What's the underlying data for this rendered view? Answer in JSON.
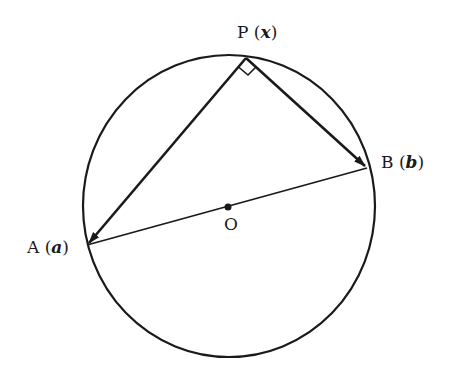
{
  "diagram": {
    "type": "geometry",
    "colors": {
      "stroke": "#1a1a1a",
      "background": "#ffffff"
    },
    "points": {
      "P": {
        "name": "P",
        "vector": "x",
        "x": 246,
        "y": 58
      },
      "A": {
        "name": "A",
        "vector": "a",
        "x": 87,
        "y": 245
      },
      "B": {
        "name": "B",
        "vector": "b",
        "x": 367,
        "y": 168
      },
      "O": {
        "name": "O",
        "x": 228,
        "y": 207
      }
    },
    "labels": {
      "P": {
        "letter": "P",
        "open": "(",
        "vec": "x",
        "close": ")"
      },
      "A": {
        "letter": "A",
        "open": "(",
        "vec": "a",
        "close": ")"
      },
      "B": {
        "letter": "B",
        "open": "(",
        "vec": "b",
        "close": ")"
      },
      "O": {
        "letter": "O"
      }
    },
    "edges": [
      {
        "from": "P",
        "to": "A",
        "arrow": true
      },
      {
        "from": "P",
        "to": "B",
        "arrow": true
      },
      {
        "from": "A",
        "to": "B",
        "arrow": false
      }
    ],
    "right_angle_marker": "P"
  }
}
